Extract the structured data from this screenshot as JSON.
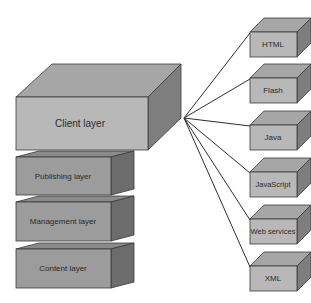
{
  "diagram": {
    "type": "layered-architecture",
    "hub": {
      "x": 184,
      "y": 118
    },
    "colors": {
      "front": "#b8b8b8",
      "top": "#a6a6a6",
      "side": "#7e7e7e",
      "stack_front": "#9c9c9c",
      "stack_top": "#8a8a8a",
      "stack_side": "#6c6c6c",
      "stroke": "#3a3a3a",
      "line": "#2e2e2e"
    },
    "client_layer": {
      "label": "Client layer"
    },
    "stack": [
      {
        "label": "Publishing layer"
      },
      {
        "label": "Management layer"
      },
      {
        "label": "Content layer"
      }
    ],
    "technologies": [
      {
        "label": "HTML"
      },
      {
        "label": "Flash"
      },
      {
        "label": "Java"
      },
      {
        "label": "JavaScript"
      },
      {
        "label": "Web services"
      },
      {
        "label": "XML"
      }
    ]
  }
}
